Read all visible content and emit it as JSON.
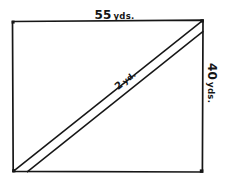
{
  "figure": {
    "type": "geometry-diagram",
    "shape": "rectangle-with-diagonal-band",
    "background_color": "#ffffff",
    "ink_color": "#161616"
  },
  "labels": {
    "width": {
      "value": "55",
      "unit": "yds."
    },
    "height": {
      "value": "40",
      "unit": "yds."
    },
    "diagonal": {
      "value": "2",
      "unit": "yd."
    }
  },
  "geometry": {
    "rectangle": {
      "left": 12,
      "top": 21,
      "right": 203,
      "bottom": 172
    },
    "band": {
      "from_corner": "bottom-left",
      "to_corner": "top-right",
      "offset": 11
    }
  }
}
